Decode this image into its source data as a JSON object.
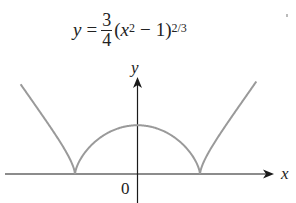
{
  "title": {
    "lhs": "y",
    "equals": "=",
    "frac_num": "3",
    "frac_den": "4",
    "open": "(",
    "var": "x",
    "sq_exp": "2",
    "minus": "−",
    "one": "1)",
    "outer_exp": "2/3"
  },
  "axes": {
    "x_label": "x",
    "y_label": "y",
    "origin_label": "0"
  },
  "colors": {
    "curve": "#9a9a9a",
    "axis": "#1a1a1a"
  },
  "chart_data": {
    "type": "line",
    "xlabel": "x",
    "ylabel": "y",
    "function": "0.75*(x^2-1)^(2/3)",
    "xlim": [
      -2.1,
      2.2
    ],
    "ylim": [
      -0.45,
      1.5
    ],
    "cusps": [
      [
        -1,
        0
      ],
      [
        1,
        0
      ]
    ],
    "local_max": [
      0,
      0.75
    ],
    "grid": false,
    "annotations": [
      "0"
    ]
  }
}
